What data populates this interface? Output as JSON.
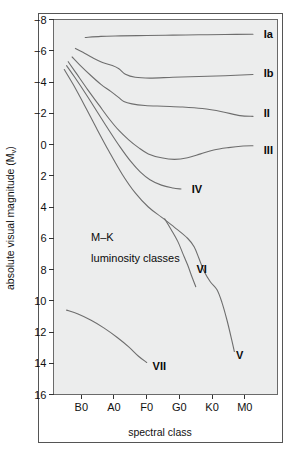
{
  "chart_data": {
    "type": "line",
    "title": "",
    "xlabel": "spectral class",
    "ylabel": "absolute visual magnitude (M",
    "ylabel_sub": "v",
    "ylabel_suffix": ")",
    "annotation_line1": "M–K",
    "annotation_line2": "luminosity classes",
    "x_categories": [
      "B0",
      "A0",
      "F0",
      "G0",
      "K0",
      "M0"
    ],
    "x_tick_values": [
      0,
      1,
      2,
      3,
      4,
      5
    ],
    "xlim": [
      -0.85,
      6.0
    ],
    "y_ticks": [
      -8,
      -6,
      -4,
      -2,
      0,
      2,
      4,
      6,
      8,
      10,
      12,
      14,
      16
    ],
    "ylim": [
      -8,
      16
    ],
    "y_axis_inverted": true,
    "grid": false,
    "legend_position": "inline-right",
    "curve_color": "#6e6e6e",
    "plot_background": "#eceded",
    "frame_color": "#555555",
    "series": [
      {
        "name": "Ia",
        "label": "Ia",
        "label_x": 5.58,
        "label_y": -7.05,
        "points": [
          [
            0.12,
            -6.85
          ],
          [
            0.6,
            -6.92
          ],
          [
            1.2,
            -6.95
          ],
          [
            2.0,
            -6.98
          ],
          [
            2.8,
            -7.0
          ],
          [
            3.6,
            -7.02
          ],
          [
            4.4,
            -7.04
          ],
          [
            5.25,
            -7.06
          ]
        ]
      },
      {
        "name": "Ib",
        "label": "Ib",
        "label_x": 5.58,
        "label_y": -4.55,
        "points": [
          [
            -0.18,
            -6.15
          ],
          [
            0.05,
            -5.9
          ],
          [
            0.35,
            -5.55
          ],
          [
            0.65,
            -5.25
          ],
          [
            0.95,
            -5.05
          ],
          [
            1.15,
            -4.85
          ],
          [
            1.35,
            -4.5
          ],
          [
            1.65,
            -4.3
          ],
          [
            2.1,
            -4.25
          ],
          [
            2.8,
            -4.3
          ],
          [
            3.6,
            -4.35
          ],
          [
            4.4,
            -4.4
          ],
          [
            5.25,
            -4.48
          ]
        ]
      },
      {
        "name": "II",
        "label": "II",
        "label_x": 5.58,
        "label_y": -2.0,
        "points": [
          [
            -0.28,
            -5.6
          ],
          [
            -0.05,
            -5.1
          ],
          [
            0.3,
            -4.4
          ],
          [
            0.6,
            -3.85
          ],
          [
            0.9,
            -3.4
          ],
          [
            1.15,
            -3.0
          ],
          [
            1.3,
            -2.75
          ],
          [
            1.55,
            -2.6
          ],
          [
            1.95,
            -2.5
          ],
          [
            2.5,
            -2.45
          ],
          [
            3.1,
            -2.4
          ],
          [
            3.7,
            -2.3
          ],
          [
            4.3,
            -2.1
          ],
          [
            4.85,
            -1.85
          ],
          [
            5.25,
            -1.8
          ]
        ]
      },
      {
        "name": "III",
        "label": "III",
        "label_x": 5.58,
        "label_y": 0.35,
        "points": [
          [
            -0.4,
            -5.3
          ],
          [
            -0.15,
            -4.55
          ],
          [
            0.2,
            -3.5
          ],
          [
            0.55,
            -2.5
          ],
          [
            0.85,
            -1.65
          ],
          [
            1.15,
            -0.9
          ],
          [
            1.45,
            -0.3
          ],
          [
            1.75,
            0.2
          ],
          [
            2.05,
            0.6
          ],
          [
            2.45,
            0.85
          ],
          [
            2.85,
            0.95
          ],
          [
            3.25,
            0.85
          ],
          [
            3.65,
            0.6
          ],
          [
            4.05,
            0.35
          ],
          [
            4.5,
            0.2
          ],
          [
            4.95,
            0.1
          ],
          [
            5.25,
            0.08
          ]
        ]
      },
      {
        "name": "IV",
        "label": "IV",
        "label_x": 3.38,
        "label_y": 2.85,
        "points": [
          [
            -0.45,
            -5.05
          ],
          [
            -0.2,
            -4.3
          ],
          [
            0.15,
            -3.2
          ],
          [
            0.5,
            -2.05
          ],
          [
            0.85,
            -0.9
          ],
          [
            1.2,
            0.2
          ],
          [
            1.5,
            1.05
          ],
          [
            1.8,
            1.75
          ],
          [
            2.1,
            2.25
          ],
          [
            2.45,
            2.6
          ],
          [
            2.8,
            2.78
          ],
          [
            3.05,
            2.85
          ]
        ]
      },
      {
        "name": "V",
        "label": "V",
        "label_x": 4.73,
        "label_y": 13.5,
        "points": [
          [
            -0.52,
            -4.8
          ],
          [
            -0.25,
            -3.85
          ],
          [
            0.1,
            -2.5
          ],
          [
            0.45,
            -1.1
          ],
          [
            0.85,
            0.45
          ],
          [
            1.25,
            1.9
          ],
          [
            1.65,
            3.1
          ],
          [
            2.05,
            4.0
          ],
          [
            2.45,
            4.65
          ],
          [
            2.85,
            5.3
          ],
          [
            3.25,
            6.0
          ],
          [
            3.45,
            6.55
          ],
          [
            3.6,
            7.3
          ],
          [
            3.75,
            8.1
          ],
          [
            3.95,
            8.8
          ],
          [
            4.15,
            9.3
          ],
          [
            4.3,
            10.1
          ],
          [
            4.45,
            11.2
          ],
          [
            4.6,
            12.5
          ],
          [
            4.68,
            13.25
          ]
        ]
      },
      {
        "name": "VI",
        "label": "VI",
        "label_x": 3.52,
        "label_y": 7.95,
        "points": [
          [
            2.55,
            4.75
          ],
          [
            2.75,
            5.45
          ],
          [
            2.95,
            6.2
          ],
          [
            3.1,
            6.95
          ],
          [
            3.25,
            7.7
          ],
          [
            3.38,
            8.45
          ],
          [
            3.5,
            9.1
          ]
        ]
      },
      {
        "name": "VII",
        "label": "VII",
        "label_x": 2.18,
        "label_y": 14.2,
        "points": [
          [
            -0.45,
            10.6
          ],
          [
            -0.1,
            10.85
          ],
          [
            0.3,
            11.25
          ],
          [
            0.7,
            11.75
          ],
          [
            1.1,
            12.35
          ],
          [
            1.45,
            12.95
          ],
          [
            1.75,
            13.55
          ],
          [
            2.0,
            13.95
          ]
        ]
      }
    ]
  }
}
